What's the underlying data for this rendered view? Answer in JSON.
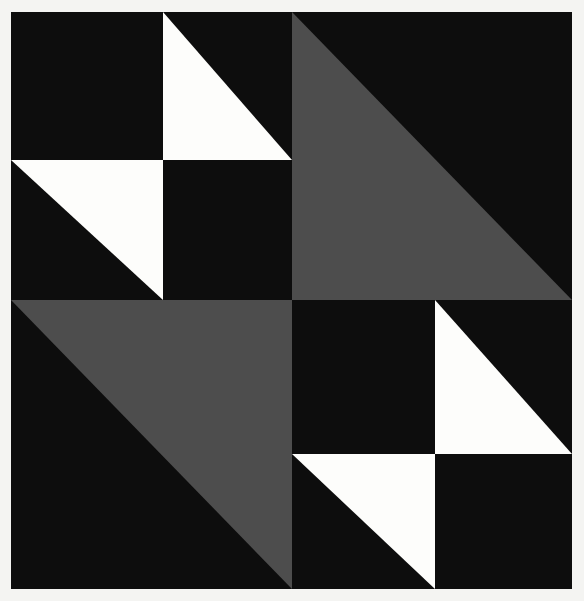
{
  "artwork": {
    "title": "Black, gray and white geometric quilt-block composition",
    "description": "Square divided into four quadrants; two quadrants contain large gray right triangles and two contain pinwheel pairs of small white right triangles on black.",
    "background_color": "#f4f4f2",
    "palette": {
      "black": "#0d0d0d",
      "gray": "#4d4d4d",
      "white": "#fdfdfb",
      "background": "#f4f4f2"
    },
    "canvas": {
      "width": 584,
      "height": 601,
      "board_x": 11,
      "board_y": 12,
      "board_width": 561,
      "board_height": 577,
      "center_x": 281,
      "center_y": 288
    },
    "quadrants": [
      {
        "name": "top-left",
        "fill": "#0d0d0d",
        "pattern": "four-cell-pinwheel",
        "rect": [
          0,
          0,
          281,
          288
        ]
      },
      {
        "name": "top-right",
        "fill": "#0d0d0d",
        "pattern": "large-gray-triangle",
        "rect": [
          281,
          0,
          280,
          288
        ]
      },
      {
        "name": "bottom-left",
        "fill": "#0d0d0d",
        "pattern": "large-gray-triangle",
        "rect": [
          0,
          288,
          281,
          289
        ]
      },
      {
        "name": "bottom-right",
        "fill": "#0d0d0d",
        "pattern": "four-cell-pinwheel",
        "rect": [
          281,
          288,
          280,
          289
        ]
      }
    ],
    "shapes": [
      {
        "id": "gray-triangle-top-right",
        "color_key": "gray",
        "orientation": "right-angle-bottom-left",
        "points": "281,0 281,288 561,288"
      },
      {
        "id": "gray-triangle-bottom-left",
        "color_key": "gray",
        "orientation": "right-angle-top-right",
        "points": "0,288 281,288 281,577"
      },
      {
        "id": "white-triangle-tl-upper-right-cell",
        "color_key": "white",
        "orientation": "right-angle-bottom-left",
        "points": "152,0 152,148 281,148"
      },
      {
        "id": "white-triangle-tl-lower-left-cell",
        "color_key": "white",
        "orientation": "right-angle-top-right",
        "points": "0,148 152,148 152,288"
      },
      {
        "id": "white-triangle-br-upper-right-cell",
        "color_key": "white",
        "orientation": "right-angle-bottom-left",
        "points": "424,288 424,442 561,442"
      },
      {
        "id": "white-triangle-br-lower-left-cell",
        "color_key": "white",
        "orientation": "right-angle-top-right",
        "points": "281,442 424,442 424,577"
      }
    ]
  }
}
